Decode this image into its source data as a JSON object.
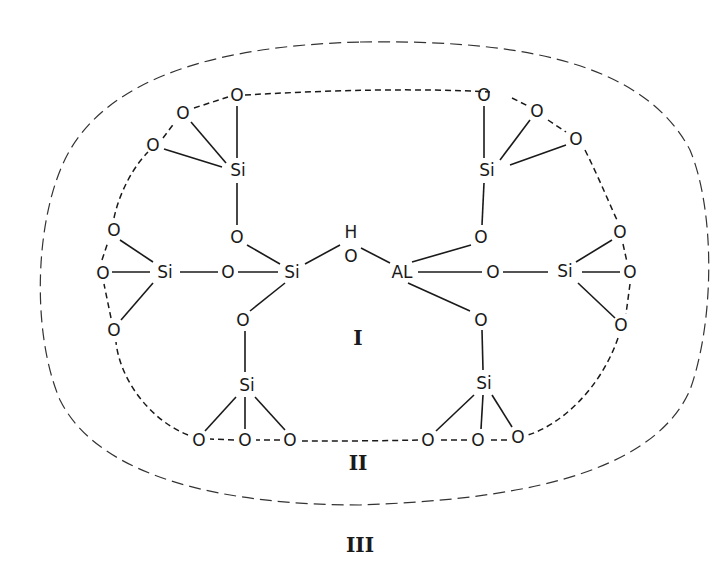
{
  "diagram": {
    "type": "zeolite-acid-site-structure",
    "atoms": {
      "si_top_left": "Si",
      "si_top_right": "Si",
      "si_left": "Si",
      "si_center": "Si",
      "si_right": "Si",
      "si_bottom_left": "Si",
      "si_bottom_right": "Si",
      "al_center": "AL",
      "h_hydroxyl": "H",
      "o_label": "O"
    },
    "regions": {
      "inner": "I",
      "ring": "II",
      "outer": "III"
    }
  }
}
